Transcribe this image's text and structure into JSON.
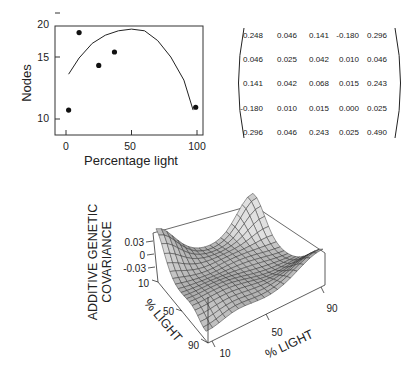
{
  "chart_data": [
    {
      "type": "scatter",
      "title": "",
      "xlabel": "Percentage light",
      "ylabel": "Nodes",
      "x_ticks": [
        0,
        50,
        100
      ],
      "y_ticks": [
        10,
        15,
        20
      ],
      "xlim": [
        -3,
        103
      ],
      "ylim": [
        9,
        20
      ],
      "y_scale": "log",
      "grid": false,
      "legend": null,
      "series": [
        {
          "name": "observed",
          "kind": "points",
          "x": [
            2,
            10,
            25,
            37,
            99
          ],
          "y": [
            10.6,
            17.6,
            14.2,
            15.5,
            10.8
          ]
        },
        {
          "name": "fitted",
          "kind": "line",
          "x": [
            2,
            10,
            20,
            30,
            40,
            50,
            60,
            70,
            80,
            90,
            97
          ],
          "y": [
            13.4,
            14.9,
            16.4,
            17.3,
            17.8,
            18.0,
            17.8,
            16.7,
            15.0,
            12.9,
            10.6
          ]
        }
      ]
    },
    {
      "type": "table",
      "title": "Additive genetic covariance matrix",
      "rows": [
        [
          "0.248",
          "0.046",
          "0.141",
          "-0.180",
          "0.296"
        ],
        [
          "0.046",
          "0.025",
          "0.042",
          "0.010",
          "0.046"
        ],
        [
          "0.141",
          "0.042",
          "0.068",
          "0.015",
          "0.243"
        ],
        [
          "-0.180",
          "0.010",
          "0.015",
          "0.000",
          "0.025"
        ],
        [
          "0.296",
          "0.046",
          "0.243",
          "0.025",
          "0.490"
        ]
      ]
    },
    {
      "type": "surface",
      "title": "",
      "zlabel_lines": [
        "ADDITIVE GENETIC",
        "COVARIANCE"
      ],
      "z_ticks": [
        "0.03",
        "0",
        "-0.03"
      ],
      "x_axis": {
        "label": "% LIGHT",
        "ticks": [
          "10",
          "50",
          "90"
        ]
      },
      "y_axis": {
        "label": "% LIGHT",
        "ticks": [
          "10",
          "50",
          "90"
        ]
      },
      "grid": "mesh",
      "zlim": [
        -0.045,
        0.045
      ]
    }
  ],
  "panel1": {
    "ylabel": "Nodes",
    "xlabel": "Percentage light",
    "y_tick_labels": [
      "20",
      "15",
      "10"
    ],
    "x_tick_labels": [
      "0",
      "50",
      "100"
    ]
  },
  "panel3": {
    "zlabel_line1": "ADDITIVE GENETIC",
    "zlabel_line2": "COVARIANCE",
    "z_tick_labels": [
      "0.03",
      "0",
      "-0.03"
    ],
    "left_axis_label": "% LIGHT",
    "left_tick_labels": [
      "10",
      "50",
      "90"
    ],
    "bottom_axis_label": "% LIGHT",
    "bottom_tick_labels": [
      "10",
      "50",
      "90"
    ]
  }
}
